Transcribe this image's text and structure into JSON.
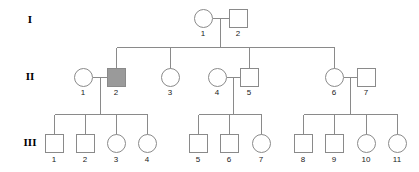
{
  "figure": {
    "type": "pedigree-chart",
    "width": 419,
    "height": 172,
    "background_color": "#ffffff",
    "line_color": "#8a8a8a",
    "unaffected_fill": "#ffffff",
    "affected_fill": "#9a9a9a",
    "legend_note": "shaded square = affected male"
  },
  "generations": [
    {
      "label": "I",
      "label_x": 30,
      "label_y": 20,
      "symbol_y": 18
    },
    {
      "label": "II",
      "label_x": 30,
      "label_y": 77,
      "symbol_y": 77
    },
    {
      "label": "III",
      "label_x": 30,
      "label_y": 143,
      "symbol_y": 143
    }
  ],
  "individuals": [
    {
      "id": "I-1",
      "number": "1",
      "generation": "I",
      "sex": "female",
      "shape": "circle",
      "affected": false,
      "x": 203,
      "y": 18,
      "label_x": 203,
      "label_y": 34
    },
    {
      "id": "I-2",
      "number": "2",
      "generation": "I",
      "sex": "male",
      "shape": "square",
      "affected": false,
      "x": 238,
      "y": 18,
      "label_x": 238,
      "label_y": 34
    },
    {
      "id": "II-1",
      "number": "1",
      "generation": "II",
      "sex": "female",
      "shape": "circle",
      "affected": false,
      "x": 83,
      "y": 77,
      "label_x": 83,
      "label_y": 93
    },
    {
      "id": "II-2",
      "number": "2",
      "generation": "II",
      "sex": "male",
      "shape": "square",
      "affected": true,
      "x": 116,
      "y": 77,
      "label_x": 116,
      "label_y": 93
    },
    {
      "id": "II-3",
      "number": "3",
      "generation": "II",
      "sex": "female",
      "shape": "circle",
      "affected": false,
      "x": 170,
      "y": 77,
      "label_x": 170,
      "label_y": 93
    },
    {
      "id": "II-4",
      "number": "4",
      "generation": "II",
      "sex": "female",
      "shape": "circle",
      "affected": false,
      "x": 217,
      "y": 77,
      "label_x": 217,
      "label_y": 93
    },
    {
      "id": "II-5",
      "number": "5",
      "generation": "II",
      "sex": "male",
      "shape": "square",
      "affected": false,
      "x": 249,
      "y": 77,
      "label_x": 249,
      "label_y": 93
    },
    {
      "id": "II-6",
      "number": "6",
      "generation": "II",
      "sex": "female",
      "shape": "circle",
      "affected": false,
      "x": 334,
      "y": 77,
      "label_x": 334,
      "label_y": 93
    },
    {
      "id": "II-7",
      "number": "7",
      "generation": "II",
      "sex": "male",
      "shape": "square",
      "affected": false,
      "x": 366,
      "y": 77,
      "label_x": 366,
      "label_y": 93
    },
    {
      "id": "III-1",
      "number": "1",
      "generation": "III",
      "sex": "male",
      "shape": "square",
      "affected": false,
      "x": 54,
      "y": 143,
      "label_x": 54,
      "label_y": 160
    },
    {
      "id": "III-2",
      "number": "2",
      "generation": "III",
      "sex": "male",
      "shape": "square",
      "affected": false,
      "x": 85,
      "y": 143,
      "label_x": 85,
      "label_y": 160
    },
    {
      "id": "III-3",
      "number": "3",
      "generation": "III",
      "sex": "female",
      "shape": "circle",
      "affected": false,
      "x": 116,
      "y": 143,
      "label_x": 116,
      "label_y": 160
    },
    {
      "id": "III-4",
      "number": "4",
      "generation": "III",
      "sex": "female",
      "shape": "circle",
      "affected": false,
      "x": 147,
      "y": 143,
      "label_x": 147,
      "label_y": 160
    },
    {
      "id": "III-5",
      "number": "5",
      "generation": "III",
      "sex": "male",
      "shape": "square",
      "affected": false,
      "x": 198,
      "y": 143,
      "label_x": 198,
      "label_y": 160
    },
    {
      "id": "III-6",
      "number": "6",
      "generation": "III",
      "sex": "male",
      "shape": "square",
      "affected": false,
      "x": 229,
      "y": 143,
      "label_x": 229,
      "label_y": 160
    },
    {
      "id": "III-7",
      "number": "7",
      "generation": "III",
      "sex": "female",
      "shape": "circle",
      "affected": false,
      "x": 261,
      "y": 143,
      "label_x": 261,
      "label_y": 160
    },
    {
      "id": "III-8",
      "number": "8",
      "generation": "III",
      "sex": "male",
      "shape": "square",
      "affected": false,
      "x": 303,
      "y": 143,
      "label_x": 303,
      "label_y": 160
    },
    {
      "id": "III-9",
      "number": "9",
      "generation": "III",
      "sex": "male",
      "shape": "square",
      "affected": false,
      "x": 334,
      "y": 143,
      "label_x": 334,
      "label_y": 160
    },
    {
      "id": "III-10",
      "number": "10",
      "generation": "III",
      "sex": "female",
      "shape": "circle",
      "affected": false,
      "x": 366,
      "y": 143,
      "label_x": 366,
      "label_y": 160
    },
    {
      "id": "III-11",
      "number": "11",
      "generation": "III",
      "sex": "female",
      "shape": "circle",
      "affected": false,
      "x": 397,
      "y": 143,
      "label_x": 397,
      "label_y": 160
    }
  ],
  "geometry": {
    "circle_radius": 9,
    "square_size": 18,
    "mating_lines": [
      {
        "name": "mating-I1-I2",
        "x1": 212,
        "y1": 18,
        "x2": 229,
        "y2": 18
      },
      {
        "name": "mating-II1-II2",
        "x1": 92,
        "y1": 77,
        "x2": 107,
        "y2": 77
      },
      {
        "name": "mating-II4-II5",
        "x1": 226,
        "y1": 77,
        "x2": 240,
        "y2": 77
      },
      {
        "name": "mating-II6-II7",
        "x1": 343,
        "y1": 77,
        "x2": 357,
        "y2": 77
      }
    ],
    "descent_drops": [
      {
        "name": "descent-I-to-sibship",
        "x": 220,
        "y1": 18,
        "y2": 47
      },
      {
        "name": "descent-II1II2-to-sibship",
        "x": 100,
        "y1": 77,
        "y2": 114
      },
      {
        "name": "descent-II4II5-to-sibship",
        "x": 233,
        "y1": 77,
        "y2": 114
      },
      {
        "name": "descent-II6II7-to-sibship",
        "x": 350,
        "y1": 77,
        "y2": 114
      }
    ],
    "sibship_lines": [
      {
        "name": "sibship-gen2",
        "y": 47,
        "x1": 116,
        "x2": 334
      },
      {
        "name": "sibship-gen3-left",
        "y": 114,
        "x1": 54,
        "x2": 147
      },
      {
        "name": "sibship-gen3-middle",
        "y": 114,
        "x1": 198,
        "x2": 261
      },
      {
        "name": "sibship-gen3-right",
        "y": 114,
        "x1": 303,
        "x2": 397
      }
    ],
    "child_drops": [
      {
        "name": "drop-to-II2",
        "x": 116,
        "y1": 47,
        "y2": 68
      },
      {
        "name": "drop-to-II3",
        "x": 170,
        "y1": 47,
        "y2": 68
      },
      {
        "name": "drop-to-II5",
        "x": 249,
        "y1": 47,
        "y2": 68
      },
      {
        "name": "drop-to-II6",
        "x": 334,
        "y1": 47,
        "y2": 68
      },
      {
        "name": "drop-to-III1",
        "x": 54,
        "y1": 114,
        "y2": 134
      },
      {
        "name": "drop-to-III2",
        "x": 85,
        "y1": 114,
        "y2": 134
      },
      {
        "name": "drop-to-III3",
        "x": 116,
        "y1": 114,
        "y2": 134
      },
      {
        "name": "drop-to-III4",
        "x": 147,
        "y1": 114,
        "y2": 134
      },
      {
        "name": "drop-to-III5",
        "x": 198,
        "y1": 114,
        "y2": 134
      },
      {
        "name": "drop-to-III6",
        "x": 229,
        "y1": 114,
        "y2": 134
      },
      {
        "name": "drop-to-III7",
        "x": 261,
        "y1": 114,
        "y2": 134
      },
      {
        "name": "drop-to-III8",
        "x": 303,
        "y1": 114,
        "y2": 134
      },
      {
        "name": "drop-to-III9",
        "x": 334,
        "y1": 114,
        "y2": 134
      },
      {
        "name": "drop-to-III10",
        "x": 366,
        "y1": 114,
        "y2": 134
      },
      {
        "name": "drop-to-III11",
        "x": 397,
        "y1": 114,
        "y2": 134
      }
    ]
  }
}
